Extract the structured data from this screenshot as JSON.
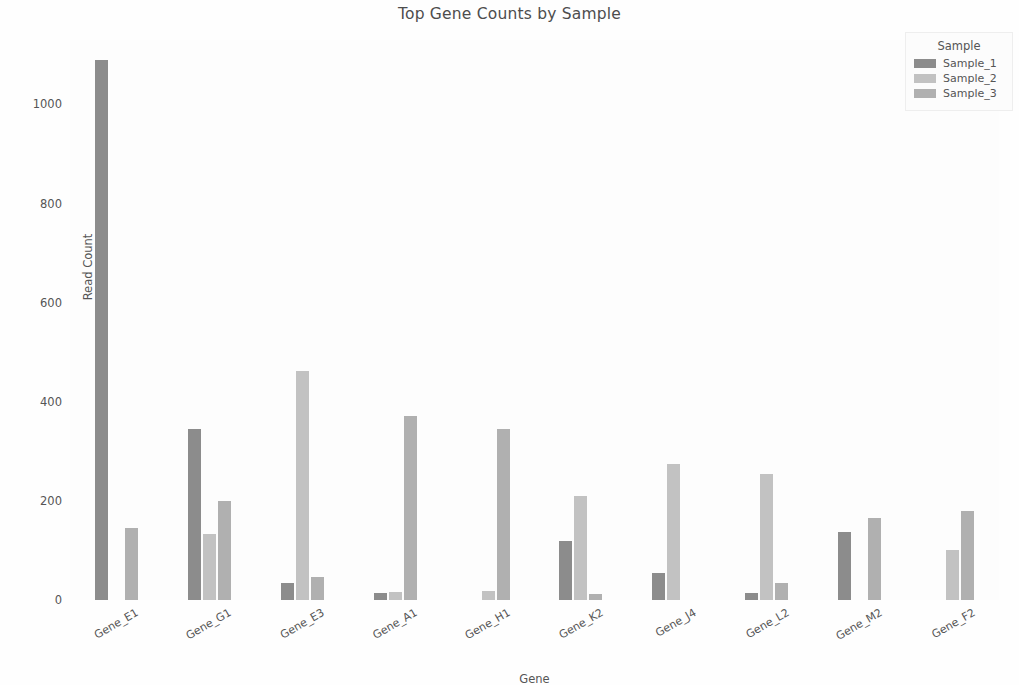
{
  "chart_data": {
    "type": "bar",
    "title": "Top Gene Counts by Sample",
    "xlabel": "Gene",
    "ylabel": "Read Count",
    "grid": false,
    "legend_position": "upper right",
    "legend_title": "Sample",
    "ylim": [
      0,
      1130
    ],
    "yticks": [
      0,
      200,
      400,
      600,
      800,
      1000
    ],
    "ytick_labels": [
      "0",
      "200",
      "400",
      "600",
      "800",
      "1000"
    ],
    "categories": [
      "Gene_E1",
      "Gene_G1",
      "Gene_E3",
      "Gene_A1",
      "Gene_H1",
      "Gene_K2",
      "Gene_J4",
      "Gene_L2",
      "Gene_M2",
      "Gene_F2"
    ],
    "series": [
      {
        "name": "Sample_1",
        "color": "#8c8c8c",
        "values": [
          1090,
          345,
          35,
          15,
          0,
          120,
          55,
          15,
          137,
          0
        ]
      },
      {
        "name": "Sample_2",
        "color": "#c2c2c2",
        "values": [
          0,
          133,
          462,
          17,
          18,
          210,
          275,
          255,
          0,
          100
        ]
      },
      {
        "name": "Sample_3",
        "color": "#b0b0b0",
        "values": [
          145,
          200,
          47,
          372,
          345,
          13,
          0,
          35,
          165,
          180
        ]
      }
    ]
  },
  "figure": {
    "background_color": "#fefefe",
    "plot_background_color": "#fdfdfd",
    "text_color": "#555555"
  }
}
